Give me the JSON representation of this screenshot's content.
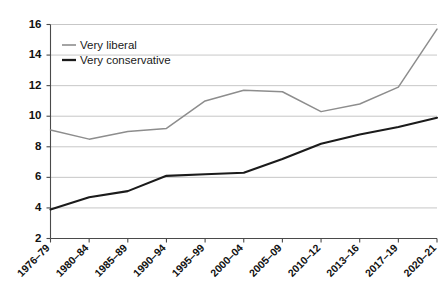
{
  "chart_data": {
    "type": "line",
    "title": "",
    "subtitle": "",
    "xlabel": "",
    "ylabel": "",
    "grid": "horizontal",
    "legend_position": "top-left",
    "ylim": [
      2,
      16
    ],
    "yticks": [
      2,
      4,
      6,
      8,
      10,
      12,
      14,
      16
    ],
    "ytick_labels": [
      "2",
      "4",
      "6",
      "8",
      "10",
      "12",
      "14",
      "16"
    ],
    "categories": [
      "1976–79",
      "1980–84",
      "1985–89",
      "1990–94",
      "1995–99",
      "2000–04",
      "2005–09",
      "2010–12",
      "2013–16",
      "2017–19",
      "2020–21"
    ],
    "series": [
      {
        "name": "Very liberal",
        "color": "#8d8d8d",
        "values": [
          9.1,
          8.5,
          9.0,
          9.2,
          11.0,
          11.7,
          11.6,
          10.3,
          10.8,
          11.9,
          15.7
        ]
      },
      {
        "name": "Very conservative",
        "color": "#1b1b1b",
        "values": [
          3.9,
          4.7,
          5.1,
          6.1,
          6.2,
          6.3,
          7.2,
          8.2,
          8.8,
          9.3,
          9.9
        ]
      }
    ]
  },
  "legend": {
    "items": [
      {
        "label": "Very liberal",
        "color": "#8d8d8d"
      },
      {
        "label": "Very conservative",
        "color": "#1b1b1b"
      }
    ]
  }
}
